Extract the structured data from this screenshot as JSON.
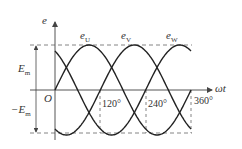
{
  "diagram": {
    "y_axis_label": "e",
    "x_axis_label": "ωt",
    "origin_label": "O",
    "amplitude_label_pos": "E",
    "amplitude_label_pos_sub": "m",
    "amplitude_label_neg": "−E",
    "amplitude_label_neg_sub": "m",
    "curves": [
      {
        "name": "e",
        "sub": "U",
        "phase_deg": 0
      },
      {
        "name": "e",
        "sub": "V",
        "phase_deg": -120
      },
      {
        "name": "e",
        "sub": "W",
        "phase_deg": -240
      }
    ],
    "ticks": [
      "120°",
      "240°",
      "360°"
    ],
    "colors": {
      "stroke": "#222222",
      "axis": "#555555",
      "dash": "#666666",
      "text": "#333333"
    }
  }
}
